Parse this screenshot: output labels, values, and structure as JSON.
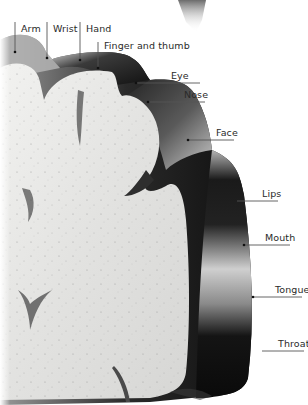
{
  "diagram": {
    "type": "anatomical-cross-section",
    "colors": {
      "background": "#ffffff",
      "white_matter": "#e6e6e4",
      "cortex_dark": "#1c1c1c",
      "cortex_mid": "#6e6e6e",
      "leader_line": "#555555",
      "label_text": "#2a2a2a"
    },
    "labels": [
      {
        "id": "arm",
        "text": "Arm"
      },
      {
        "id": "wrist",
        "text": "Wrist"
      },
      {
        "id": "hand",
        "text": "Hand"
      },
      {
        "id": "finger-thumb",
        "text": "Finger and thumb"
      },
      {
        "id": "eye",
        "text": "Eye"
      },
      {
        "id": "nose",
        "text": "Nose"
      },
      {
        "id": "face",
        "text": "Face"
      },
      {
        "id": "lips",
        "text": "Lips"
      },
      {
        "id": "mouth",
        "text": "Mouth"
      },
      {
        "id": "tongue",
        "text": "Tongue"
      },
      {
        "id": "throat",
        "text": "Throat"
      }
    ]
  }
}
